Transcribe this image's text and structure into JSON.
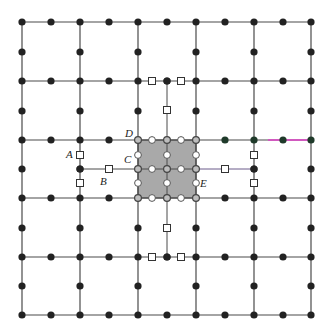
{
  "diagram": {
    "title": "",
    "grid": {
      "xs": [
        22,
        80,
        138,
        196,
        254,
        311
      ],
      "ys": [
        22,
        81,
        140,
        198,
        257,
        315
      ],
      "line_color": "#4a4a4a"
    },
    "refined_patch": {
      "x": 138,
      "y": 140,
      "width": 58,
      "height": 58,
      "inner_x": 167,
      "inner_y": 169,
      "fill": "#a9a9a9"
    },
    "extra_lines": [
      {
        "x1": 167,
        "y1": 81,
        "x2": 167,
        "y2": 140,
        "style": "sub"
      },
      {
        "x1": 167,
        "y1": 198,
        "x2": 167,
        "y2": 257,
        "style": "sub"
      },
      {
        "x1": 80,
        "y1": 169,
        "x2": 138,
        "y2": 169,
        "style": "sub"
      },
      {
        "x1": 196,
        "y1": 169,
        "x2": 254,
        "y2": 169,
        "style": "purple"
      }
    ],
    "highlight_segment": {
      "x1": 268,
      "y1": 140,
      "x2": 311,
      "y2": 140,
      "color": "#e040c8"
    },
    "open_squares": [
      [
        152,
        81
      ],
      [
        181,
        81
      ],
      [
        167,
        110
      ],
      [
        80,
        155
      ],
      [
        80,
        183
      ],
      [
        109,
        169
      ],
      [
        254,
        155
      ],
      [
        254,
        183
      ],
      [
        225,
        169
      ],
      [
        167,
        228
      ],
      [
        152,
        257
      ],
      [
        181,
        257
      ]
    ],
    "open_circles": [
      [
        152,
        140
      ],
      [
        181,
        140
      ],
      [
        138,
        155
      ],
      [
        167,
        155
      ],
      [
        196,
        155
      ],
      [
        152,
        169
      ],
      [
        181,
        169
      ],
      [
        138,
        183
      ],
      [
        167,
        183
      ],
      [
        196,
        183
      ],
      [
        152,
        198
      ],
      [
        181,
        198
      ]
    ],
    "ringed_nodes": [
      [
        138,
        140
      ],
      [
        167,
        140
      ],
      [
        196,
        140
      ],
      [
        138,
        169
      ],
      [
        167,
        169
      ],
      [
        196,
        169
      ],
      [
        138,
        198
      ],
      [
        167,
        198
      ],
      [
        196,
        198
      ]
    ],
    "extra_dots": [
      [
        167,
        81
      ],
      [
        167,
        257
      ],
      [
        80,
        169
      ],
      [
        254,
        169
      ]
    ],
    "green_dots": [
      [
        225,
        140
      ],
      [
        254,
        140
      ],
      [
        283,
        140
      ],
      [
        311,
        140
      ]
    ],
    "labels": [
      {
        "id": "A",
        "text": "A",
        "x": 66,
        "y": 149
      },
      {
        "id": "B",
        "text": "B",
        "x": 100,
        "y": 176
      },
      {
        "id": "C",
        "text": "C",
        "x": 124,
        "y": 154
      },
      {
        "id": "D",
        "text": "D",
        "x": 125,
        "y": 128
      },
      {
        "id": "E",
        "text": "E",
        "x": 200,
        "y": 178
      }
    ]
  }
}
